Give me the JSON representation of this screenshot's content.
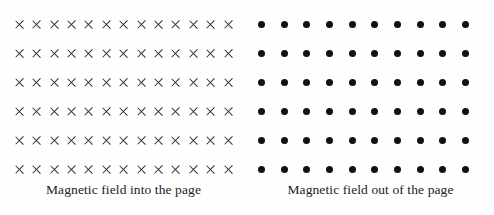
{
  "figure": {
    "background_color": "#fefefe",
    "panels": [
      {
        "id": "into-the-page",
        "caption": "Magnetic field into the page",
        "marker": "cross-icon",
        "marker_color": "#2b2b2b",
        "rows": 6,
        "columns": 13
      },
      {
        "id": "out-of-the-page",
        "caption": "Magnetic field out of the page",
        "marker": "dot-icon",
        "marker_color": "#111111",
        "rows": 6,
        "columns": 10
      }
    ]
  }
}
